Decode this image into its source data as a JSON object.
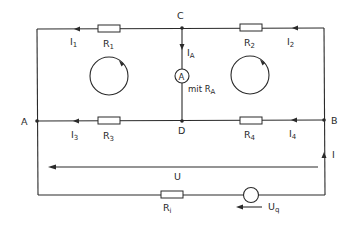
{
  "diagram": {
    "type": "electrical-circuit",
    "nodes": {
      "A": "A",
      "B": "B",
      "C": "C",
      "D": "D"
    },
    "resistors": {
      "r1": {
        "main": "R",
        "sub": "1"
      },
      "r2": {
        "main": "R",
        "sub": "2"
      },
      "r3": {
        "main": "R",
        "sub": "3"
      },
      "r4": {
        "main": "R",
        "sub": "4"
      },
      "ri": {
        "main": "R",
        "sub": "i"
      }
    },
    "currents": {
      "i1": {
        "main": "I",
        "sub": "1"
      },
      "i2": {
        "main": "I",
        "sub": "2"
      },
      "i3": {
        "main": "I",
        "sub": "3"
      },
      "i4": {
        "main": "I",
        "sub": "4"
      },
      "ia": {
        "main": "I",
        "sub": "A"
      },
      "i": {
        "main": "I"
      }
    },
    "ammeter": {
      "symbol": "A",
      "note_prefix": "mit R",
      "note_sub": "A"
    },
    "voltages": {
      "u": {
        "main": "U"
      },
      "uq": {
        "main": "U",
        "sub": "q"
      }
    },
    "mesh_loops": [
      {
        "id": "left-mesh",
        "direction": "clockwise"
      },
      {
        "id": "right-mesh",
        "direction": "clockwise"
      }
    ],
    "line_color": "#2a2a2a",
    "background": "#ffffff"
  }
}
